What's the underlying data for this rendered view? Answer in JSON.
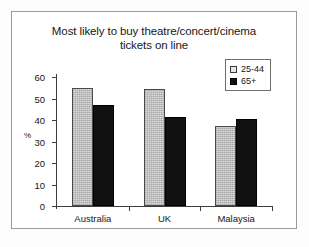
{
  "chart_data": {
    "type": "bar",
    "title": "Most likely to buy theatre/concert/cinema\ntickets on line",
    "xlabel": "",
    "ylabel": "%",
    "ylim": [
      0,
      60
    ],
    "yticks": [
      0,
      10,
      20,
      30,
      40,
      50,
      60
    ],
    "ytick_labels": [
      "0",
      "10",
      "20",
      "30",
      "40",
      "50",
      "60"
    ],
    "grid": false,
    "legend_position": "top-right",
    "categories": [
      "Australia",
      "UK",
      "Malaysia"
    ],
    "series": [
      {
        "name": "25-44",
        "values": [
          55,
          54.5,
          37
        ],
        "color": "#d9d9d9"
      },
      {
        "name": "65+",
        "values": [
          47,
          41.5,
          40.5
        ],
        "color": "#111111"
      }
    ]
  },
  "legend": {
    "items": [
      {
        "label": "25-44",
        "swatch": "light-hatched-square"
      },
      {
        "label": "65+",
        "swatch": "dark-filled-square"
      }
    ]
  },
  "colors": {
    "frame": "#9a9a9a",
    "axis": "#3d3d3d",
    "text": "#161616",
    "series_light": "#d9d9d9",
    "series_dark": "#111111",
    "background": "#ffffff"
  }
}
